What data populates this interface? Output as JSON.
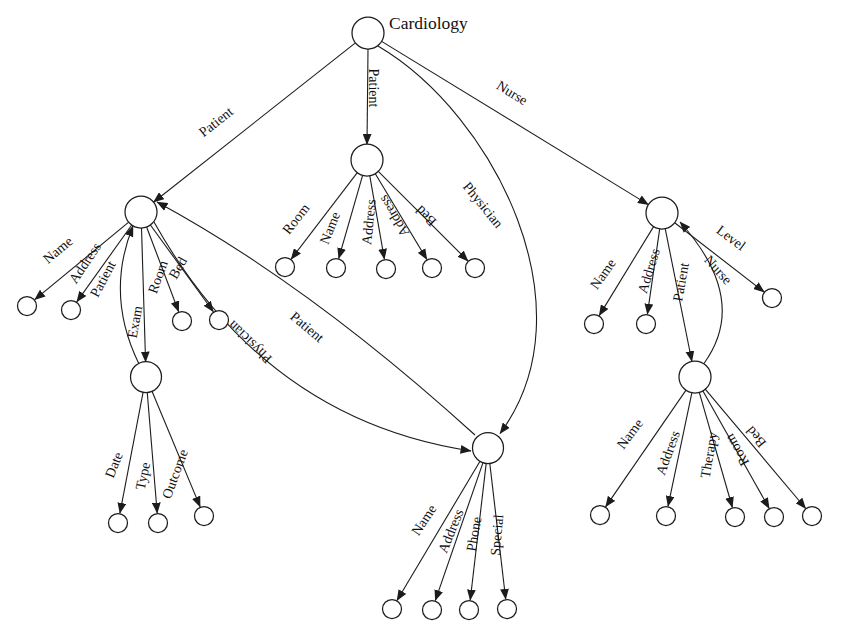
{
  "title": "Cardiology",
  "colors": {
    "line": "#1c1c1c",
    "node_fill": "#ffffff",
    "text": "#111111",
    "background": "#ffffff"
  },
  "diagram": {
    "nodes": [
      {
        "id": "cardiology-root",
        "x": 368,
        "y": 33,
        "r": 16,
        "label": "Cardiology",
        "label_x": 389,
        "label_y": 29
      },
      {
        "id": "patient-left",
        "x": 141,
        "y": 212,
        "r": 16
      },
      {
        "id": "patient-middle",
        "x": 367,
        "y": 160,
        "r": 16
      },
      {
        "id": "nurse",
        "x": 662,
        "y": 213,
        "r": 16
      },
      {
        "id": "exam",
        "x": 146,
        "y": 377,
        "r": 15.5
      },
      {
        "id": "physician",
        "x": 488,
        "y": 448,
        "r": 15.5
      },
      {
        "id": "patient-right",
        "x": 695,
        "y": 377,
        "r": 16
      },
      {
        "id": "leaf-pl-name",
        "x": 27,
        "y": 306,
        "r": 9.5
      },
      {
        "id": "leaf-pl-address",
        "x": 71,
        "y": 310,
        "r": 9.5
      },
      {
        "id": "leaf-pl-room",
        "x": 182,
        "y": 321,
        "r": 9.5
      },
      {
        "id": "leaf-pl-bed",
        "x": 219,
        "y": 320,
        "r": 9.5
      },
      {
        "id": "leaf-pm-room",
        "x": 285,
        "y": 267,
        "r": 9.5
      },
      {
        "id": "leaf-pm-name",
        "x": 336,
        "y": 268,
        "r": 9.5
      },
      {
        "id": "leaf-pm-address1",
        "x": 386,
        "y": 269,
        "r": 9.5
      },
      {
        "id": "leaf-pm-address2",
        "x": 432,
        "y": 268,
        "r": 9.5
      },
      {
        "id": "leaf-pm-bed",
        "x": 475,
        "y": 268,
        "r": 9.5
      },
      {
        "id": "leaf-n-name",
        "x": 594,
        "y": 324,
        "r": 9.5
      },
      {
        "id": "leaf-n-address",
        "x": 646,
        "y": 324,
        "r": 9.5
      },
      {
        "id": "leaf-n-level",
        "x": 772,
        "y": 298,
        "r": 9.5
      },
      {
        "id": "leaf-ex-date",
        "x": 118,
        "y": 523,
        "r": 9.5
      },
      {
        "id": "leaf-ex-type",
        "x": 158,
        "y": 523,
        "r": 9.5
      },
      {
        "id": "leaf-ex-outcome",
        "x": 204,
        "y": 516,
        "r": 9.5
      },
      {
        "id": "leaf-ph-name",
        "x": 392,
        "y": 609,
        "r": 9.5
      },
      {
        "id": "leaf-ph-address",
        "x": 432,
        "y": 610,
        "r": 9.5
      },
      {
        "id": "leaf-ph-phone",
        "x": 469,
        "y": 610,
        "r": 9.5
      },
      {
        "id": "leaf-ph-special",
        "x": 507,
        "y": 609,
        "r": 9.5
      },
      {
        "id": "leaf-pr-name",
        "x": 600,
        "y": 515,
        "r": 9.5
      },
      {
        "id": "leaf-pr-address",
        "x": 666,
        "y": 516,
        "r": 9.5
      },
      {
        "id": "leaf-pr-therapy",
        "x": 735,
        "y": 517,
        "r": 9.5
      },
      {
        "id": "leaf-pr-room",
        "x": 774,
        "y": 517,
        "r": 9.5
      },
      {
        "id": "leaf-pr-bed",
        "x": 812,
        "y": 516,
        "r": 9.5
      }
    ],
    "edges": [
      {
        "id": "root-to-patient-left",
        "path": "M 355.4 42.9 L 153.5 202.2",
        "label": "Patient",
        "lx": 216,
        "ly": 122,
        "rot": -38.5
      },
      {
        "id": "root-to-patient-middle",
        "path": "M 368 49 L 367 144.5",
        "label": "Patient",
        "lx": 373,
        "ly": 88,
        "rot": 90
      },
      {
        "id": "root-to-physician",
        "path": "M 378 46 C 495 115, 592 310, 500 433.5",
        "label": "Physician",
        "lx": 483,
        "ly": 205,
        "rot": 51
      },
      {
        "id": "root-to-nurse",
        "path": "M 381.6 41.4 L 648.4 204.6",
        "label": "Nurse",
        "lx": 512,
        "ly": 93,
        "rot": 31.5
      },
      {
        "id": "patient-left-name",
        "path": "M 128.7 222.2 L 34.7 299.7",
        "label": "Name",
        "lx": 58,
        "ly": 250,
        "rot": -40
      },
      {
        "id": "patient-left-address",
        "path": "M 131.7 225 L 76.8 301.9",
        "label": "Address",
        "lx": 85,
        "ly": 263,
        "rot": -56
      },
      {
        "id": "patient-left-room",
        "path": "M 146.6 227 L 178.7 311.7",
        "label": "Room",
        "lx": 158,
        "ly": 277,
        "rot": -70
      },
      {
        "id": "patient-left-bed",
        "path": "M 150.4 225 L 213.4 311.7",
        "label": "Bed",
        "lx": 178,
        "ly": 268,
        "rot": -60
      },
      {
        "id": "patient-left-exam",
        "path": "M 141.5 228 L 145.6 362",
        "label": "Exam",
        "lx": 135,
        "ly": 322,
        "rot": -80
      },
      {
        "id": "patient-left-to-physician",
        "path": "M 154 222 Q 265 420, 471 451",
        "label": "Physician",
        "lx": 250,
        "ly": 342,
        "rot": 224
      },
      {
        "id": "physician-to-patient-left",
        "path": "M 475 435 Q 310 285, 157 202",
        "label": "Patient",
        "lx": 307,
        "ly": 327,
        "rot": 40
      },
      {
        "id": "exam-to-patient-left",
        "path": "M 139 364 Q 105 295, 133 226",
        "label": "Patient",
        "lx": 103,
        "ly": 279,
        "rot": -62
      },
      {
        "id": "patient-middle-room",
        "path": "M 357.3 172.7 L 291.1 259.2",
        "label": "Room",
        "lx": 296,
        "ly": 219,
        "rot": -52
      },
      {
        "id": "patient-middle-name",
        "path": "M 362.6 175.4 L 338.7 258.5",
        "label": "Name",
        "lx": 330,
        "ly": 228,
        "rot": -68
      },
      {
        "id": "patient-middle-address1",
        "path": "M 369.8 175.8 L 384.4 259.2",
        "label": "Address",
        "lx": 369,
        "ly": 222,
        "rot": -84
      },
      {
        "id": "patient-middle-address2",
        "path": "M 375.3 173.7 L 426.9 259.5",
        "label": "Address",
        "lx": 394,
        "ly": 216,
        "rot": 239
      },
      {
        "id": "patient-middle-bed",
        "path": "M 378.3 171.3 L 468 261",
        "label": "Bed",
        "lx": 426,
        "ly": 216,
        "rot": 225
      },
      {
        "id": "nurse-name",
        "path": "M 653.6 226.6 L 599.2 315.6",
        "label": "Name",
        "lx": 603,
        "ly": 274,
        "rot": -55
      },
      {
        "id": "nurse-address",
        "path": "M 659.7 228.8 L 647.4 314.2",
        "label": "Address",
        "lx": 649,
        "ly": 271,
        "rot": -73
      },
      {
        "id": "nurse-level",
        "path": "M 674.7 222.8 L 764.2 292",
        "label": "Level",
        "lx": 731,
        "ly": 238,
        "rot": 37
      },
      {
        "id": "nurse-to-patient-right",
        "path": "M 665.2 228.7 L 691.9 361.5",
        "label": "Patient",
        "lx": 681,
        "ly": 282,
        "rot": -80
      },
      {
        "id": "patient-right-to-nurse",
        "path": "M 704 363.5 Q 750 300, 680 222",
        "label": "Nurse",
        "lx": 718,
        "ly": 270,
        "rot": 48
      },
      {
        "id": "patient-right-name",
        "path": "M 686 390.1 L 605.6 506.9",
        "label": "Name",
        "lx": 630,
        "ly": 434,
        "rot": -53
      },
      {
        "id": "patient-right-address",
        "path": "M 691.9 392.6 L 668 506.3",
        "label": "Address",
        "lx": 668,
        "ly": 453,
        "rot": -70
      },
      {
        "id": "patient-right-therapy",
        "path": "M 699.3 392.3 L 732.4 507.5",
        "label": "Therapy",
        "lx": 709,
        "ly": 455,
        "rot": -80
      },
      {
        "id": "patient-right-room",
        "path": "M 702.8 390.8 L 769.2 508.4",
        "label": "Room",
        "lx": 737,
        "ly": 450,
        "rot": 240
      },
      {
        "id": "patient-right-bed",
        "path": "M 705.2 389.1 L 805.7 508.5",
        "label": "Bed",
        "lx": 756,
        "ly": 437,
        "rot": 230
      },
      {
        "id": "exam-date",
        "path": "M 143.2 391.7 L 119.9 513.3",
        "label": "Date",
        "lx": 114,
        "ly": 465,
        "rot": -68
      },
      {
        "id": "exam-type",
        "path": "M 147.2 392 L 157.2 513.1",
        "label": "Type",
        "lx": 143,
        "ly": 476,
        "rot": -78
      },
      {
        "id": "exam-outcome",
        "path": "M 151.8 390.8 L 200.2 506.9",
        "label": "Outcome",
        "lx": 175,
        "ly": 474,
        "rot": -70
      },
      {
        "id": "physician-name",
        "path": "M 480 461.3 L 397 600.5",
        "label": "Name",
        "lx": 424,
        "ly": 520,
        "rot": -56
      },
      {
        "id": "physician-address",
        "path": "M 483 462.6 L 435.3 600.6",
        "label": "Address",
        "lx": 451,
        "ly": 531,
        "rot": -68
      },
      {
        "id": "physician-phone",
        "path": "M 486.2 463.4 L 470.2 600.2",
        "label": "Phone",
        "lx": 474,
        "ly": 534,
        "rot": -80
      },
      {
        "id": "physician-special",
        "path": "M 489.8 463.4 L 505.7 599.3",
        "label": "Special",
        "lx": 497,
        "ly": 535,
        "rot": -85
      }
    ]
  }
}
